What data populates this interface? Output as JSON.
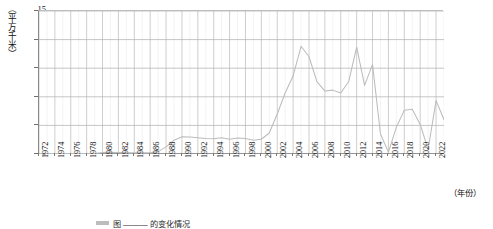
{
  "chart_data": {
    "type": "line",
    "title": "",
    "xlabel": "（年份）",
    "ylabel": "（平方千米）",
    "ylim": [
      0,
      15
    ],
    "xlim": [
      1972,
      2023
    ],
    "yticks": [
      0,
      3,
      6,
      9,
      12,
      15
    ],
    "ytick_labels": [
      "0",
      "3",
      "6",
      "9",
      "12",
      "15"
    ],
    "xticks": [
      1972,
      1974,
      1976,
      1978,
      1980,
      1982,
      1984,
      1986,
      1988,
      1990,
      1992,
      1994,
      1996,
      1998,
      2000,
      2002,
      2004,
      2006,
      2008,
      2010,
      2012,
      2014,
      2016,
      2018,
      2020,
      2022
    ],
    "xtick_labels": [
      "1972",
      "1974",
      "1976",
      "1978",
      "1980",
      "1982",
      "1984",
      "1986",
      "1988",
      "1990",
      "1992",
      "1994",
      "1996",
      "1998",
      "2000",
      "2002",
      "2004",
      "2006",
      "2008",
      "2010",
      "2012",
      "2014",
      "2016",
      "2018",
      "2020",
      "2022"
    ],
    "grid": true,
    "grid_minor_x": true,
    "legend": "",
    "line_color": "#b9b9b9",
    "grid_color": "#d8d8d8",
    "axis_color": "#8a8a8a",
    "series": [
      {
        "name": "面积",
        "x": [
          1972,
          1973,
          1974,
          1975,
          1976,
          1977,
          1978,
          1979,
          1980,
          1981,
          1982,
          1983,
          1984,
          1985,
          1986,
          1987,
          1988,
          1989,
          1990,
          1991,
          1992,
          1993,
          1994,
          1995,
          1996,
          1997,
          1998,
          1999,
          2000,
          2001,
          2002,
          2003,
          2004,
          2005,
          2006,
          2007,
          2008,
          2009,
          2010,
          2011,
          2012,
          2013,
          2014,
          2015,
          2016,
          2017,
          2018,
          2019,
          2020,
          2021,
          2022,
          2023
        ],
        "values": [
          0.05,
          0.05,
          0.05,
          0.05,
          0.05,
          0.05,
          0.05,
          0.05,
          0.15,
          0.18,
          0.15,
          0.12,
          0.12,
          0.12,
          0.12,
          0.25,
          0.75,
          1.45,
          1.8,
          1.78,
          1.7,
          1.62,
          1.6,
          1.7,
          1.55,
          1.68,
          1.62,
          1.45,
          1.55,
          2.2,
          4.2,
          6.4,
          8.2,
          11.3,
          10.2,
          7.6,
          6.6,
          6.7,
          6.4,
          7.6,
          11.2,
          7.2,
          9.4,
          2.1,
          0.2,
          2.8,
          4.6,
          4.7,
          3.1,
          0.5,
          5.6,
          3.6
        ]
      }
    ]
  },
  "caption": {
    "swatch_label": "",
    "text": "图 ——— 的变化情况"
  }
}
